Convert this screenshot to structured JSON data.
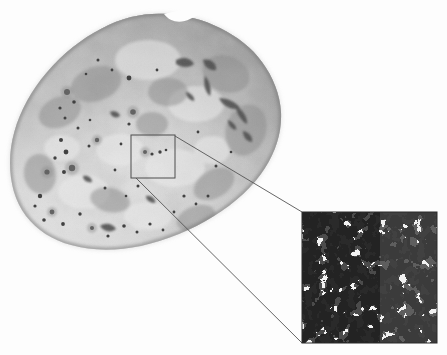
{
  "figure": {
    "type": "micrograph-with-magnified-inset",
    "title": "Grayscale specimen photograph with magnified microstructure inset",
    "background_color": "#fdfdfd",
    "width": 447,
    "height": 355
  },
  "specimen": {
    "name": "rock-specimen",
    "description": "Irregular ovoid pitted rock specimen, grayscale photograph",
    "bounds": {
      "x": 10,
      "y": 14,
      "width": 272,
      "height": 237
    },
    "base_color": "#b9b9b9",
    "highlight_color": "#e4e4e4",
    "shadow_color": "#8d8d8d",
    "edge_shadow_color": "#6f6f6f",
    "pit_color": "#4a4a4a"
  },
  "roi": {
    "name": "region-of-interest-square",
    "label": "",
    "x": 131,
    "y": 135,
    "width": 44,
    "height": 43,
    "stroke_color": "#4c4c4c",
    "stroke_width": 1
  },
  "leader_lines": {
    "stroke_color": "#555555",
    "stroke_width": 0.9,
    "upper": {
      "x1": 175,
      "y1": 136,
      "x2": 302,
      "y2": 212
    },
    "lower": {
      "x1": 136,
      "y1": 178,
      "x2": 302,
      "y2": 343
    }
  },
  "inset": {
    "name": "magnified-microstructure-inset",
    "x": 302,
    "y": 212,
    "width": 135,
    "height": 131,
    "foreground_color": "#2b2b2b",
    "background_color": "#f2f2f2",
    "border_color": "#2b2b2b",
    "pattern": "binary-porous-network",
    "feature_scale_px": 4
  },
  "chart_data": {
    "type": "heatmap",
    "xlabel": "",
    "ylabel": "",
    "grid": false,
    "legend_position": "none",
    "series": [
      {
        "name": "solid-phase",
        "color": "#2b2b2b",
        "area_fraction": 0.62
      },
      {
        "name": "pore-phase",
        "color": "#f2f2f2",
        "area_fraction": 0.38
      }
    ]
  }
}
